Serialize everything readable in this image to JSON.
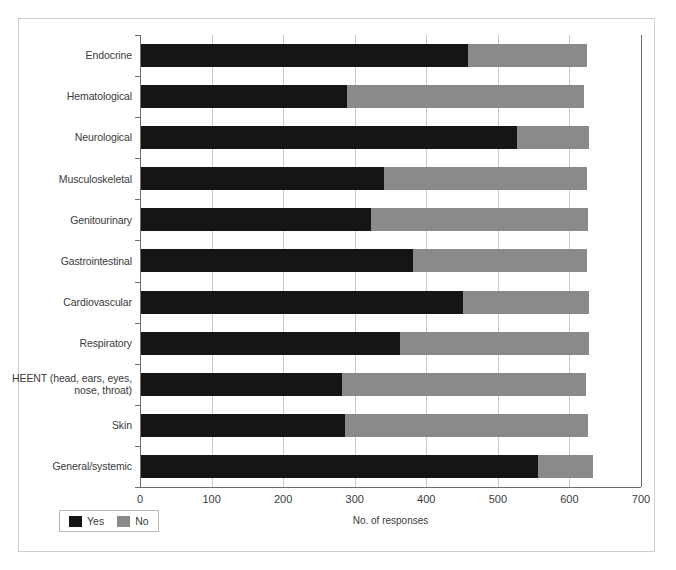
{
  "chart_data": {
    "type": "bar",
    "orientation": "horizontal",
    "stacked": true,
    "title": "",
    "xlabel": "No. of responses",
    "ylabel": "",
    "xlim": [
      0,
      700
    ],
    "xticks": [
      0,
      100,
      200,
      300,
      400,
      500,
      600,
      700
    ],
    "xticklabels": [
      "0",
      "100",
      "200",
      "300",
      "400",
      "500",
      "600",
      "700"
    ],
    "grid": true,
    "grid_axis": "x",
    "legend": [
      "Yes",
      "No"
    ],
    "legend_position": "bottom-left",
    "colors": {
      "Yes": "#151515",
      "No": "#8a8a8a"
    },
    "categories": [
      "Endocrine",
      "Hematological",
      "Neurological",
      "Musculoskeletal",
      "Genitourinary",
      "Gastrointestinal",
      "Cardiovascular",
      "Respiratory",
      "HEENT (head, ears, eyes,\nnose, throat)",
      "Skin",
      "General/systemic"
    ],
    "series": [
      {
        "name": "Yes",
        "values": [
          458,
          289,
          527,
          341,
          323,
          381,
          451,
          363,
          282,
          286,
          556
        ]
      },
      {
        "name": "No",
        "values": [
          166,
          332,
          101,
          283,
          303,
          243,
          177,
          265,
          341,
          340,
          77
        ]
      }
    ],
    "totals": [
      624,
      621,
      628,
      624,
      626,
      624,
      628,
      628,
      623,
      626,
      633
    ]
  },
  "legend": {
    "yes_label": "Yes",
    "no_label": "No"
  },
  "axis": {
    "x_title": "No. of responses"
  }
}
